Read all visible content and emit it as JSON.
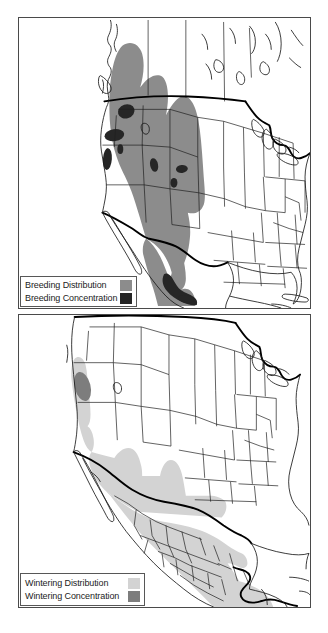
{
  "figure": {
    "type": "species-range-maps",
    "panel_count": 2
  },
  "maps": [
    {
      "id": "breeding",
      "name": "breeding-range-map",
      "region": "North America",
      "legend": {
        "rows": [
          {
            "label": "Breeding Distribution",
            "color": "#8c8c8c",
            "swatch_name": "breeding-distribution-swatch"
          },
          {
            "label": "Breeding Concentration",
            "color": "#262626",
            "swatch_name": "breeding-concentration-swatch"
          }
        ]
      }
    },
    {
      "id": "wintering",
      "name": "wintering-range-map",
      "region": "North America",
      "legend": {
        "rows": [
          {
            "label": "Wintering Distribution",
            "color": "#d3d3d3",
            "swatch_name": "wintering-distribution-swatch"
          },
          {
            "label": "Wintering Concentration",
            "color": "#7d7d7d",
            "swatch_name": "wintering-concentration-swatch"
          }
        ]
      }
    }
  ],
  "colors": {
    "breeding_distribution": "#8c8c8c",
    "breeding_concentration": "#262626",
    "wintering_distribution": "#d3d3d3",
    "wintering_concentration": "#7d7d7d",
    "country_border": "#000000",
    "state_border": "#1a1a1a",
    "frame": "#4a4a4a",
    "background": "#ffffff"
  }
}
